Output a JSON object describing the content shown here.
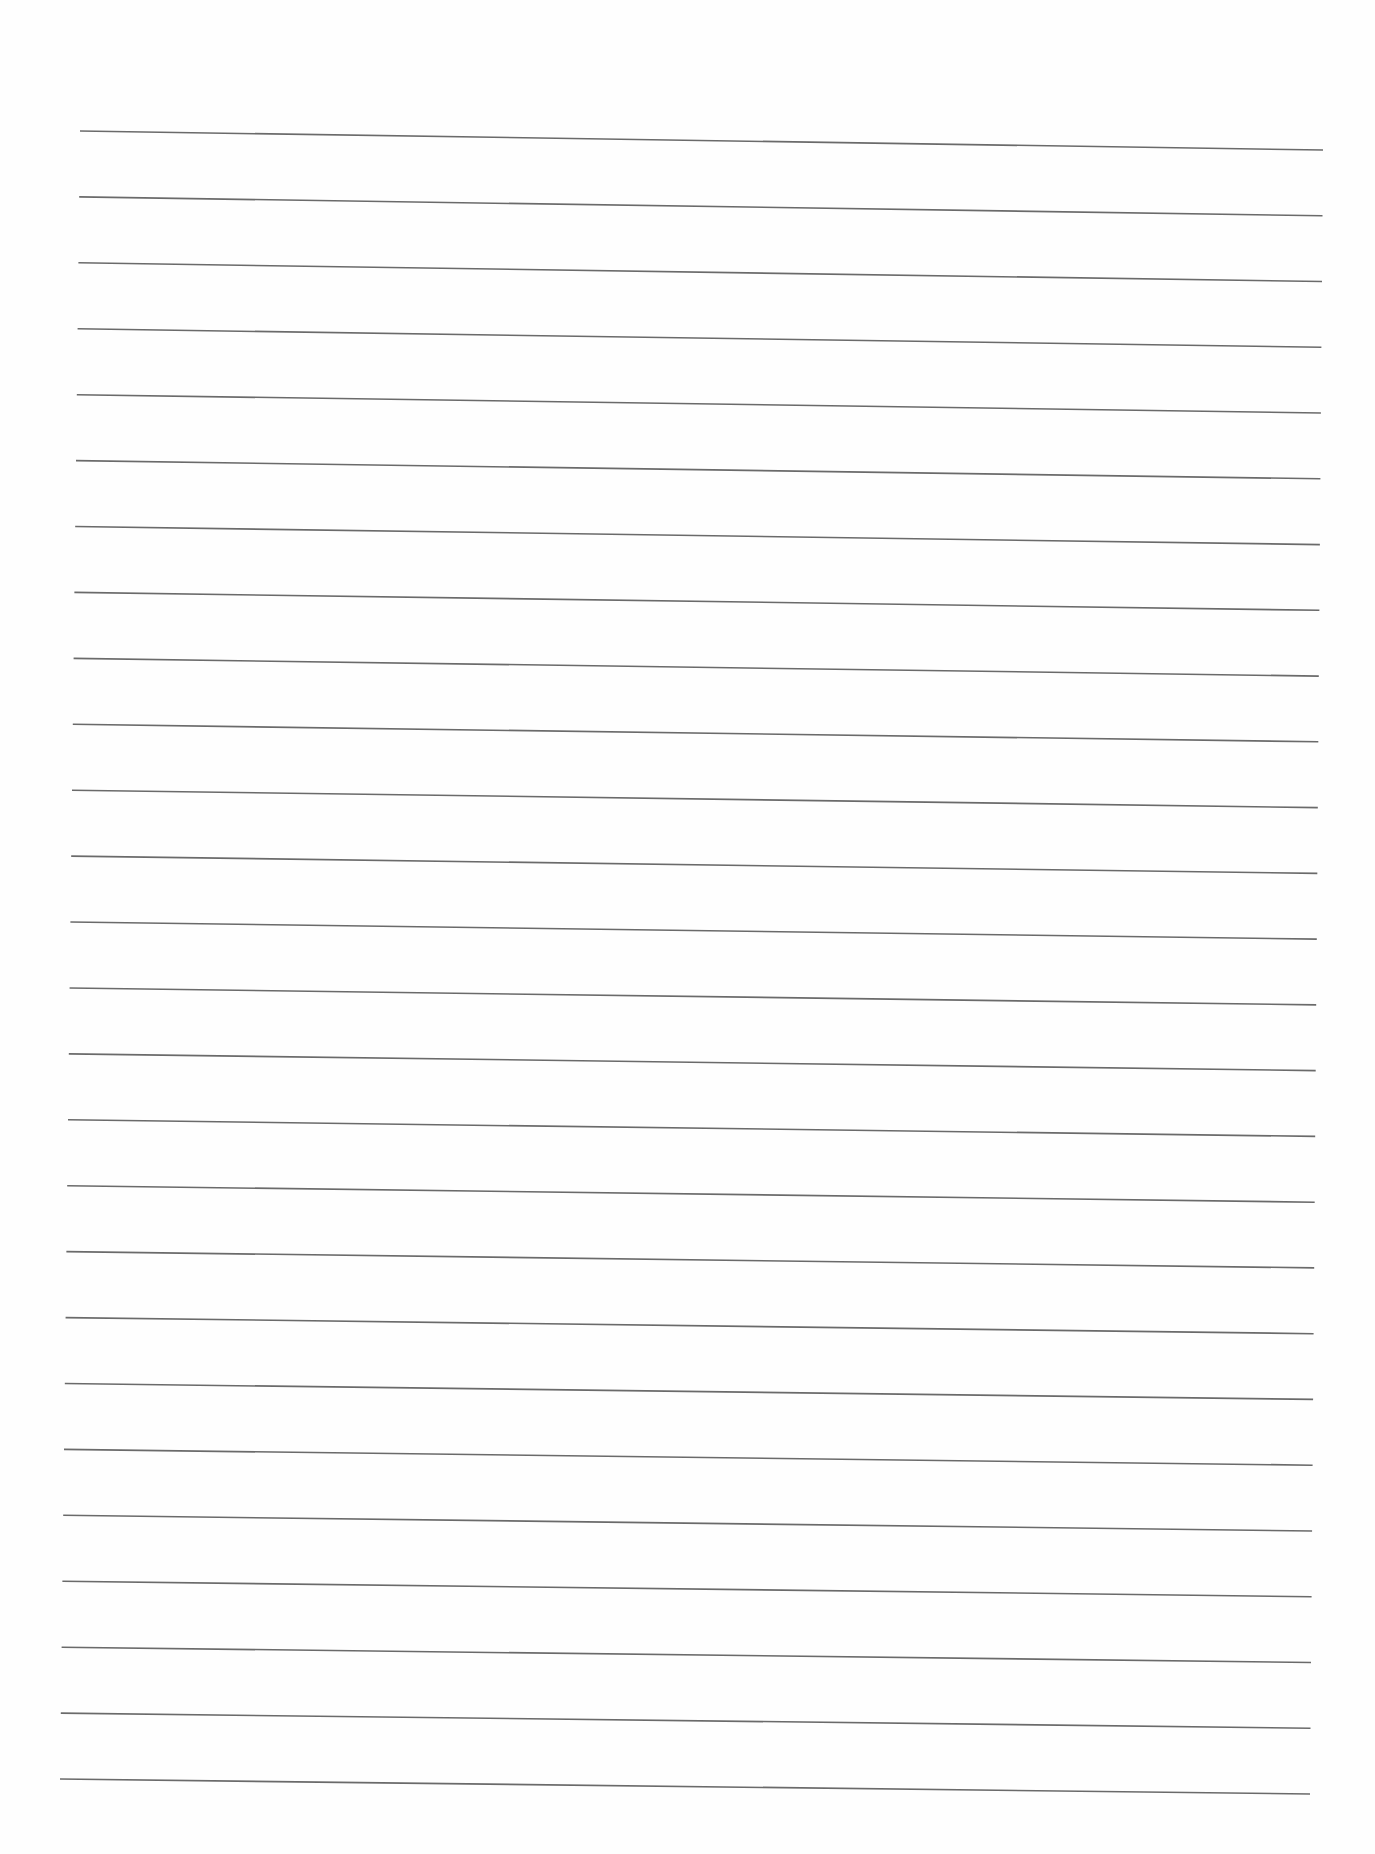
{
  "page": {
    "type": "ruled-paper",
    "background_color": "#fefefe",
    "line_color": "#6a6a6a",
    "line_count": 26
  },
  "rules": {
    "first": {
      "x1": 80,
      "y1": 131,
      "x2": 1323,
      "y2": 150
    },
    "last": {
      "x1": 60,
      "y1": 1779,
      "x2": 1310,
      "y2": 1794
    }
  }
}
